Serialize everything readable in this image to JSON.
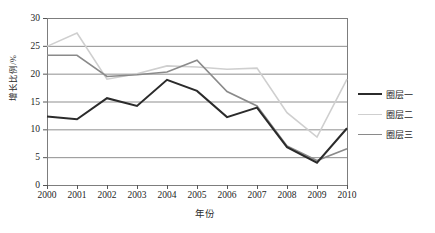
{
  "chart_data": {
    "type": "line",
    "title": "",
    "xlabel": "年份",
    "ylabel": "增长比例/%",
    "categories": [
      "2000",
      "2001",
      "2002",
      "2003",
      "2004",
      "2005",
      "2006",
      "2007",
      "2008",
      "2009",
      "2010"
    ],
    "x": [
      2000,
      2001,
      2002,
      2003,
      2004,
      2005,
      2006,
      2007,
      2008,
      2009,
      2010
    ],
    "ylim": [
      0,
      30
    ],
    "yticks": [
      "0",
      "5",
      "10",
      "15",
      "20",
      "25",
      "30"
    ],
    "ytick_values": [
      0,
      5,
      10,
      15,
      20,
      25,
      30
    ],
    "grid": "horizontal",
    "legend_position": "right",
    "series": [
      {
        "name": "圈层一",
        "color": "#2b2b2b",
        "width": 2.0,
        "values": [
          12.3,
          11.8,
          15.6,
          14.2,
          18.9,
          16.9,
          12.2,
          13.9,
          6.8,
          4.0,
          10.2
        ]
      },
      {
        "name": "圈层二",
        "color": "#cfcfcf",
        "width": 1.6,
        "values": [
          24.9,
          27.3,
          19.0,
          20.0,
          21.4,
          21.2,
          20.8,
          21.0,
          13.0,
          8.6,
          19.0
        ]
      },
      {
        "name": "圈层三",
        "color": "#8a8a8a",
        "width": 1.6,
        "values": [
          23.3,
          23.3,
          19.5,
          19.8,
          20.3,
          22.4,
          16.8,
          14.2,
          7.0,
          4.4,
          6.5
        ]
      }
    ]
  },
  "axes": {
    "frame_color": "#7d7d7d",
    "grid_color": "#8f8f8f",
    "tick_color": "#555555"
  }
}
